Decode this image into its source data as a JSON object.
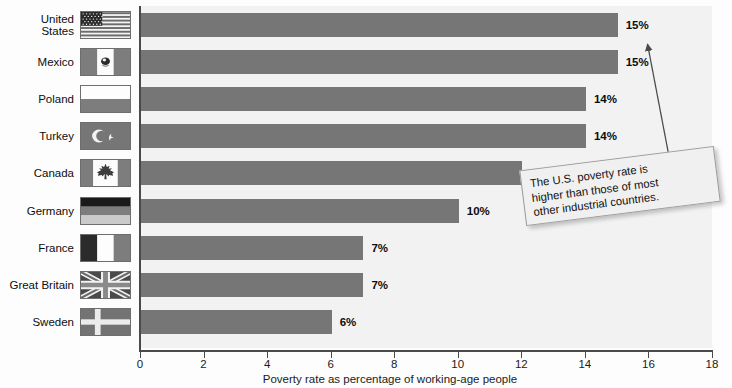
{
  "chart_data": {
    "type": "bar",
    "orientation": "horizontal",
    "title": "",
    "xlabel": "Poverty rate as percentage of working-age people",
    "ylabel": "",
    "xlim": [
      0,
      18
    ],
    "xticks": [
      0,
      2,
      4,
      6,
      8,
      10,
      12,
      14,
      16,
      18
    ],
    "grid": false,
    "legend": false,
    "categories": [
      "United States",
      "Mexico",
      "Poland",
      "Turkey",
      "Canada",
      "Germany",
      "France",
      "Great Britain",
      "Sweden"
    ],
    "values": [
      15,
      15,
      14,
      14,
      12,
      10,
      7,
      7,
      6
    ],
    "value_labels": [
      "15%",
      "15%",
      "14%",
      "14%",
      "12%",
      "10%",
      "7%",
      "7%",
      "6%"
    ],
    "annotations": [
      {
        "text": "The U.S. poverty rate is higher than those of most other industrial countries.",
        "points_to": "United States"
      }
    ],
    "colors": {
      "bar": "#767676",
      "plot_background": "#f2f2f2",
      "axis": "#4a4a4a",
      "text": "#0d0d0d",
      "callout_background": "#f0f0f0",
      "callout_border": "#9a9a9a"
    }
  },
  "axis": {
    "x_title": "Poverty rate as percentage of working-age people",
    "ticks": [
      {
        "label": "0"
      },
      {
        "label": "2"
      },
      {
        "label": "4"
      },
      {
        "label": "6"
      },
      {
        "label": "8"
      },
      {
        "label": "10"
      },
      {
        "label": "12"
      },
      {
        "label": "14"
      },
      {
        "label": "16"
      },
      {
        "label": "18"
      }
    ]
  },
  "rows": [
    {
      "country": "United States",
      "country_line1": "United",
      "country_line2": "States",
      "value": 15,
      "value_label": "15%",
      "flag": "flag-united-states"
    },
    {
      "country": "Mexico",
      "country_line1": "Mexico",
      "country_line2": "",
      "value": 15,
      "value_label": "15%",
      "flag": "flag-mexico"
    },
    {
      "country": "Poland",
      "country_line1": "Poland",
      "country_line2": "",
      "value": 14,
      "value_label": "14%",
      "flag": "flag-poland"
    },
    {
      "country": "Turkey",
      "country_line1": "Turkey",
      "country_line2": "",
      "value": 14,
      "value_label": "14%",
      "flag": "flag-turkey"
    },
    {
      "country": "Canada",
      "country_line1": "Canada",
      "country_line2": "",
      "value": 12,
      "value_label": "12%",
      "flag": "flag-canada"
    },
    {
      "country": "Germany",
      "country_line1": "Germany",
      "country_line2": "",
      "value": 10,
      "value_label": "10%",
      "flag": "flag-germany"
    },
    {
      "country": "France",
      "country_line1": "France",
      "country_line2": "",
      "value": 7,
      "value_label": "7%",
      "flag": "flag-france"
    },
    {
      "country": "Great Britain",
      "country_line1": "Great Britain",
      "country_line2": "",
      "value": 7,
      "value_label": "7%",
      "flag": "flag-great-britain"
    },
    {
      "country": "Sweden",
      "country_line1": "Sweden",
      "country_line2": "",
      "value": 6,
      "value_label": "6%",
      "flag": "flag-sweden"
    }
  ],
  "callout": {
    "line1": "The U.S. poverty rate is",
    "line2": "higher than those of most",
    "line3": "other industrial countries."
  }
}
